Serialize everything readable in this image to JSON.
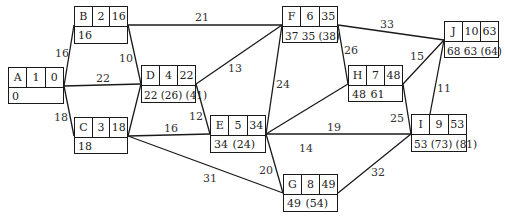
{
  "nodes": {
    "A": {
      "name": "A",
      "duration": "1",
      "es": "0",
      "bottom": "0"
    },
    "B": {
      "name": "B",
      "duration": "2",
      "es": "16",
      "bottom": "16"
    },
    "C": {
      "name": "C",
      "duration": "3",
      "es": "18",
      "bottom": "18"
    },
    "D": {
      "name": "D",
      "duration": "4",
      "es": "22",
      "bottom": "22 (26) (41)"
    },
    "E": {
      "name": "E",
      "duration": "5",
      "es": "34",
      "bottom": "34 (24)"
    },
    "F": {
      "name": "F",
      "duration": "6",
      "es": "35",
      "bottom": "37  35 (38)"
    },
    "G": {
      "name": "G",
      "duration": "8",
      "es": "49",
      "bottom": "49 (54)"
    },
    "H": {
      "name": "H",
      "duration": "7",
      "es": "48",
      "bottom": "48  61"
    },
    "I": {
      "name": "I",
      "duration": "9",
      "es": "53",
      "bottom": "53 (73) (81)"
    },
    "J": {
      "name": "J",
      "duration": "10",
      "es": "63",
      "bottom": "68  63 (64)"
    }
  },
  "edges": [
    {
      "from": "A",
      "to": "B",
      "label": "16"
    },
    {
      "from": "A",
      "to": "D",
      "label": "22"
    },
    {
      "from": "A",
      "to": "C",
      "label": "18"
    },
    {
      "from": "B",
      "to": "F",
      "label": "21"
    },
    {
      "from": "B",
      "to": "D",
      "label": "10"
    },
    {
      "from": "C",
      "to": "D",
      "label": ""
    },
    {
      "from": "C",
      "to": "E",
      "label": "16"
    },
    {
      "from": "C",
      "to": "G",
      "label": "31"
    },
    {
      "from": "D",
      "to": "F",
      "label": "13"
    },
    {
      "from": "D",
      "to": "E",
      "label": "12"
    },
    {
      "from": "E",
      "to": "F",
      "label": "24"
    },
    {
      "from": "E",
      "to": "H",
      "label": "14"
    },
    {
      "from": "E",
      "to": "I",
      "label": "19"
    },
    {
      "from": "E",
      "to": "G",
      "label": "20"
    },
    {
      "from": "F",
      "to": "J",
      "label": "33"
    },
    {
      "from": "F",
      "to": "H",
      "label": "26"
    },
    {
      "from": "H",
      "to": "J",
      "label": "15"
    },
    {
      "from": "H",
      "to": "I",
      "label": "25"
    },
    {
      "from": "I",
      "to": "J",
      "label": "11"
    },
    {
      "from": "G",
      "to": "I",
      "label": "32"
    }
  ]
}
